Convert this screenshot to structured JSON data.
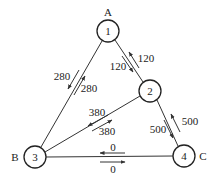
{
  "nodes": [
    {
      "id": "1",
      "site": "A",
      "x": 108,
      "y": 31
    },
    {
      "id": "2",
      "site": "",
      "x": 150,
      "y": 91
    },
    {
      "id": "3",
      "site": "B",
      "x": 35,
      "y": 157
    },
    {
      "id": "4",
      "site": "C",
      "x": 184,
      "y": 156
    }
  ],
  "edges": [
    {
      "from": "1",
      "to": "3",
      "flows": [
        "280",
        "280"
      ]
    },
    {
      "from": "1",
      "to": "2",
      "flows": [
        "120",
        "120"
      ]
    },
    {
      "from": "2",
      "to": "3",
      "flows": [
        "380",
        "380"
      ]
    },
    {
      "from": "2",
      "to": "4",
      "flows": [
        "500",
        "500"
      ]
    },
    {
      "from": "3",
      "to": "4",
      "flows": [
        "0",
        "0"
      ]
    }
  ],
  "labels": {
    "site_a": "A",
    "site_b": "B",
    "site_c": "C",
    "node_1": "1",
    "node_2": "2",
    "node_3": "3",
    "node_4": "4",
    "edge_1_3_left": "280",
    "edge_1_3_right": "280",
    "edge_1_2_right": "120",
    "edge_1_2_left": "120",
    "edge_2_3_upper": "380",
    "edge_2_3_lower": "380",
    "edge_2_4_right": "500",
    "edge_2_4_left": "500",
    "edge_3_4_upper": "0",
    "edge_3_4_lower": "0"
  }
}
